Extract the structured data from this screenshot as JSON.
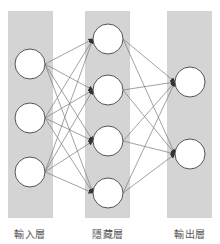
{
  "diagram": {
    "title": "",
    "type": "neural-network",
    "colors": {
      "background": "#ffffff",
      "layer_band": "#d4d4d4",
      "node_fill": "#ffffff",
      "node_stroke": "#555555",
      "edge": "#7a7a7a",
      "arrow": "#333333",
      "label": "#555555"
    },
    "layers": [
      {
        "name": "input",
        "label": "輸入層",
        "node_count": 3
      },
      {
        "name": "hidden",
        "label": "隱藏層",
        "node_count": 4
      },
      {
        "name": "output",
        "label": "輸出層",
        "node_count": 2
      }
    ],
    "connections": "fully-connected, directed left-to-right"
  }
}
